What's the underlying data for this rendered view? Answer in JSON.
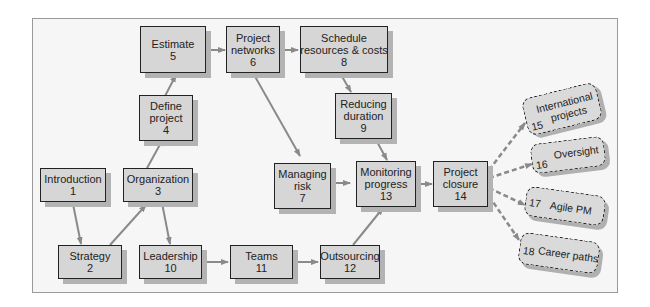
{
  "diagram": {
    "title": "",
    "nodes": [
      {
        "id": 1,
        "line1": "Introduction",
        "line2": "",
        "num": "1"
      },
      {
        "id": 2,
        "line1": "Strategy",
        "line2": "",
        "num": "2"
      },
      {
        "id": 3,
        "line1": "Organization",
        "line2": "",
        "num": "3"
      },
      {
        "id": 4,
        "line1": "Define",
        "line2": "project",
        "num": "4"
      },
      {
        "id": 5,
        "line1": "Estimate",
        "line2": "",
        "num": "5"
      },
      {
        "id": 6,
        "line1": "Project",
        "line2": "networks",
        "num": "6"
      },
      {
        "id": 7,
        "line1": "Managing",
        "line2": "risk",
        "num": "7"
      },
      {
        "id": 8,
        "line1": "Schedule",
        "line2": "resources & costs",
        "num": "8"
      },
      {
        "id": 9,
        "line1": "Reducing",
        "line2": "duration",
        "num": "9"
      },
      {
        "id": 10,
        "line1": "Leadership",
        "line2": "",
        "num": "10"
      },
      {
        "id": 11,
        "line1": "Teams",
        "line2": "",
        "num": "11"
      },
      {
        "id": 12,
        "line1": "Outsourcing",
        "line2": "",
        "num": "12"
      },
      {
        "id": 13,
        "line1": "Monitoring",
        "line2": "progress",
        "num": "13"
      },
      {
        "id": 14,
        "line1": "Project",
        "line2": "closure",
        "num": "14"
      }
    ],
    "future_topics": [
      {
        "id": 15,
        "line1": "International",
        "line2": "projects",
        "num": "15"
      },
      {
        "id": 16,
        "line1": "Oversight",
        "line2": "",
        "num": "16"
      },
      {
        "id": 17,
        "line1": "Agile PM",
        "line2": "",
        "num": "17"
      },
      {
        "id": 18,
        "line1": "Career paths",
        "line2": "",
        "num": "18"
      }
    ],
    "edges": [
      [
        1,
        2
      ],
      [
        2,
        3
      ],
      [
        3,
        4
      ],
      [
        4,
        5
      ],
      [
        5,
        6
      ],
      [
        6,
        8
      ],
      [
        8,
        9
      ],
      [
        6,
        7
      ],
      [
        3,
        10
      ],
      [
        10,
        11
      ],
      [
        11,
        12
      ],
      [
        7,
        13
      ],
      [
        9,
        13
      ],
      [
        12,
        13
      ],
      [
        13,
        14
      ]
    ],
    "dashed_edges": [
      [
        14,
        15
      ],
      [
        14,
        16
      ],
      [
        14,
        17
      ],
      [
        14,
        18
      ]
    ],
    "colors": {
      "box_fill": "#d6d6d6",
      "border": "#222222",
      "arrow": "#8a8a8a",
      "background": "#f6f6f6"
    }
  }
}
